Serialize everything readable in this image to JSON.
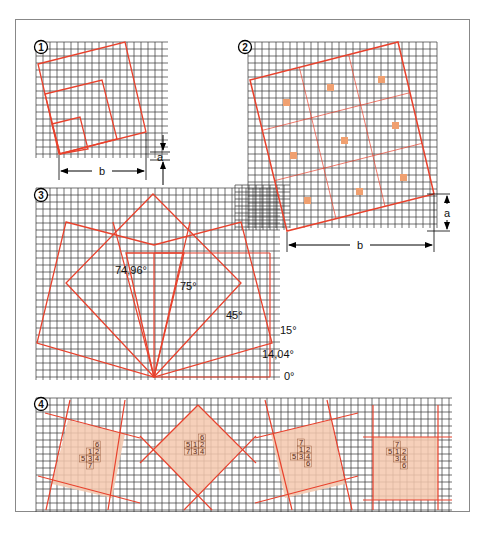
{
  "figure": {
    "panels": [
      {
        "id": "1",
        "badge": "1",
        "label_a": "a",
        "label_b": "b"
      },
      {
        "id": "2",
        "badge": "2",
        "label_a": "a",
        "label_b": "b"
      },
      {
        "id": "3",
        "badge": "3",
        "angle_labels": [
          "74,96°",
          "75°",
          "45°",
          "15°",
          "14,04°",
          "0°"
        ]
      },
      {
        "id": "4",
        "badge": "4",
        "cells": [
          {
            "rows": [
              [
                "",
                "",
                "6"
              ],
              [
                "",
                "1",
                "2"
              ],
              [
                "5",
                "3",
                "4"
              ],
              [
                "",
                "7",
                ""
              ]
            ]
          },
          {
            "rows": [
              [
                "",
                "",
                "6"
              ],
              [
                "5",
                "1",
                "2"
              ],
              [
                "7",
                "3",
                "4"
              ]
            ]
          },
          {
            "rows": [
              [
                "",
                "7",
                ""
              ],
              [
                "",
                "1",
                "2"
              ],
              [
                "5",
                "3",
                "4"
              ],
              [
                "",
                "",
                "6"
              ]
            ]
          },
          {
            "rows": [
              [
                "",
                "7",
                ""
              ],
              [
                "5",
                "1",
                "2"
              ],
              [
                "",
                "3",
                "4"
              ],
              [
                "",
                "",
                "6"
              ]
            ]
          }
        ]
      }
    ],
    "colors": {
      "grid": "#333333",
      "red": "#e8412c",
      "fill": "#f4c8ae",
      "square": "#f0a070"
    }
  }
}
